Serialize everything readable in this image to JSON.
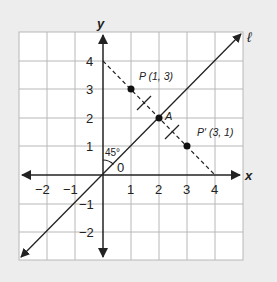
{
  "axes": {
    "x_label": "x",
    "y_label": "y",
    "x_ticks": [
      "−2",
      "−1",
      "1",
      "2",
      "3",
      "4"
    ],
    "y_ticks": [
      "4",
      "3",
      "2",
      "1",
      "−1",
      "−2"
    ],
    "origin_label": "0"
  },
  "line": {
    "label": "ℓ",
    "equation": "y = x"
  },
  "angle": {
    "label": "45°"
  },
  "points": {
    "P": {
      "label": "P (1, 3)",
      "x": 1,
      "y": 3
    },
    "A": {
      "label": "A",
      "x": 2,
      "y": 2
    },
    "P_prime": {
      "label": "P′ (3, 1)",
      "x": 3,
      "y": 1
    }
  },
  "segment": {
    "style": "dashed",
    "from": [
      0,
      4
    ],
    "to": [
      4,
      0
    ]
  },
  "colors": {
    "background": "#ededed",
    "grid_bg": "#ffffff",
    "grid_line": "#b8b8b8",
    "ink": "#222222"
  }
}
